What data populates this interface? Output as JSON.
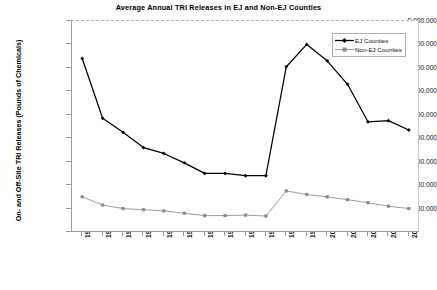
{
  "chart_data": {
    "type": "line",
    "title": "Average Annual TRI Releases in EJ and Non-EJ Counties",
    "xlabel": "",
    "ylabel": "On- and Off-Site TRI Releases (Pounds of Chemicals)",
    "x": [
      1988,
      1989,
      1990,
      1991,
      1992,
      1993,
      1994,
      1995,
      1996,
      1997,
      1998,
      1999,
      2000,
      2001,
      2002,
      2003,
      2004
    ],
    "categories": [
      "1988",
      "1989",
      "1990",
      "1991",
      "1992",
      "1993",
      "1994",
      "1995",
      "1996",
      "1997",
      "1998",
      "1999",
      "2000",
      "2001",
      "2002",
      "2003",
      "2004"
    ],
    "ylim": [
      0,
      9000000
    ],
    "ytick_values": [
      0,
      1000000,
      2000000,
      3000000,
      4000000,
      5000000,
      6000000,
      7000000,
      8000000,
      9000000
    ],
    "ytick_labels": [
      "",
      "1.000.000",
      "2.000.000",
      "3.000.000",
      "4.000.000",
      "5.000.000",
      "6.000.000",
      "7.000.000",
      "8.000.000",
      "9.000.000"
    ],
    "grid": false,
    "legend_position": "top-right",
    "series": [
      {
        "name": "EJ Counties",
        "color": "#000000",
        "marker": "diamond",
        "values": [
          7400000,
          4850000,
          4250000,
          3600000,
          3350000,
          2950000,
          2500000,
          2500000,
          2400000,
          2400000,
          7050000,
          8000000,
          7300000,
          6300000,
          4700000,
          4750000,
          4350000
        ]
      },
      {
        "name": "Non-EJ Counties",
        "color": "#8c8c8c",
        "marker": "square",
        "values": [
          1500000,
          1150000,
          1000000,
          950000,
          900000,
          800000,
          700000,
          700000,
          720000,
          680000,
          1750000,
          1600000,
          1500000,
          1380000,
          1250000,
          1100000,
          1000000
        ]
      }
    ]
  },
  "legend": {
    "items": [
      {
        "label": "EJ Counties"
      },
      {
        "label": "Non-EJ Counties"
      }
    ]
  }
}
